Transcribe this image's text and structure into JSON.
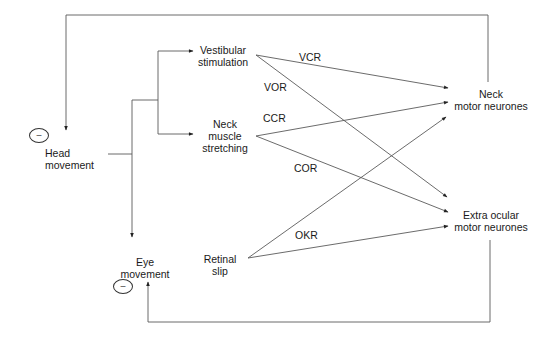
{
  "nodes": {
    "head_movement": {
      "line1": "Head",
      "line2": "movement"
    },
    "eye_movement": {
      "line1": "Eye",
      "line2": "movement"
    },
    "vestibular_stimulation": {
      "line1": "Vestibular",
      "line2": "stimulation"
    },
    "neck_muscle_stretching": {
      "line1": "Neck",
      "line2": "muscle",
      "line3": "stretching"
    },
    "retinal_slip": {
      "line1": "Retinal",
      "line2": "slip"
    },
    "neck_motor_neurones": {
      "line1": "Neck",
      "line2": "motor neurones"
    },
    "extra_ocular_motor_neurones": {
      "line1": "Extra ocular",
      "line2": "motor neurones"
    }
  },
  "reflexes": {
    "vcr": "VCR",
    "vor": "VOR",
    "ccr": "CCR",
    "cor": "COR",
    "okr": "OKR"
  },
  "feedback": {
    "head_sign": "–",
    "eye_sign": "–"
  },
  "edges": [
    {
      "from": "Head movement",
      "to": "Vestibular stimulation"
    },
    {
      "from": "Head movement",
      "to": "Neck muscle stretching"
    },
    {
      "from": "Head movement",
      "to": "Eye movement"
    },
    {
      "from": "Vestibular stimulation",
      "to": "Neck motor neurones",
      "label": "VCR"
    },
    {
      "from": "Vestibular stimulation",
      "to": "Extra ocular motor neurones",
      "label": "VOR"
    },
    {
      "from": "Neck muscle stretching",
      "to": "Neck motor neurones",
      "label": "CCR"
    },
    {
      "from": "Neck muscle stretching",
      "to": "Extra ocular motor neurones",
      "label": "COR"
    },
    {
      "from": "Retinal slip",
      "to": "Neck motor neurones"
    },
    {
      "from": "Retinal slip",
      "to": "Extra ocular motor neurones",
      "label": "OKR"
    },
    {
      "from": "Neck motor neurones",
      "to": "Head movement",
      "sign": "-"
    },
    {
      "from": "Extra ocular motor neurones",
      "to": "Eye movement",
      "sign": "-"
    }
  ],
  "colors": {
    "line": "#555555",
    "text": "#1a1a1a"
  }
}
